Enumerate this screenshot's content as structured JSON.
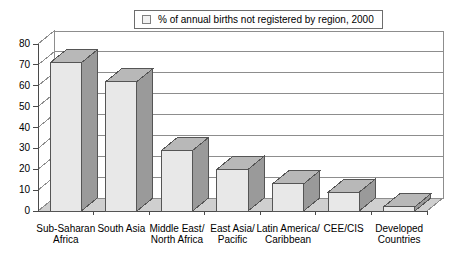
{
  "legend": {
    "marker": "legend-swatch",
    "label": "% of annual births not registered by region, 2000"
  },
  "chart_data": {
    "type": "bar",
    "title": "",
    "subtitle": "",
    "xlabel": "",
    "ylabel": "",
    "ylim": [
      0,
      80
    ],
    "yticks": [
      0,
      10,
      20,
      30,
      40,
      50,
      60,
      70,
      80
    ],
    "grid": true,
    "legend_position": "top-center",
    "style": "3d-column",
    "categories": [
      "Sub-Saharan\nAfrica",
      "South Asia",
      "Middle East/\nNorth Africa",
      "East Asia/\nPacific",
      "Latin America/\nCaribbean",
      "CEE/CIS",
      "Developed\nCountries"
    ],
    "series": [
      {
        "name": "% of annual births not registered by region, 2000",
        "values": [
          71,
          62,
          29,
          20,
          13,
          9,
          2
        ]
      }
    ]
  },
  "colors": {
    "bar_front": "#e8e8e8",
    "bar_side": "#9a9a9a",
    "bar_top": "#b8b8b8",
    "bar_outline": "#555555",
    "grid": "#8d8d8d",
    "axis": "#4a4a4a",
    "floor": "#cfcfcf",
    "wall": "#ffffff",
    "text": "#000000"
  }
}
